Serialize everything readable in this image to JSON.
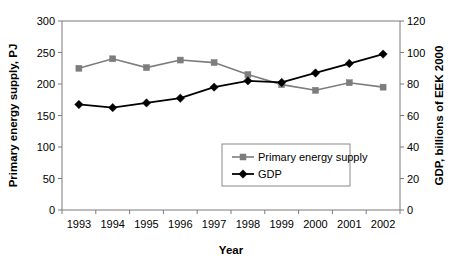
{
  "chart_data": {
    "type": "line",
    "title": "",
    "xlabel": "Year",
    "categories": [
      "1993",
      "1994",
      "1995",
      "1996",
      "1997",
      "1998",
      "1999",
      "2000",
      "2001",
      "2002"
    ],
    "grid": false,
    "legend_position": "inside-center-right",
    "axes": {
      "left": {
        "label": "Primary energy supply, PJ",
        "ticks": [
          "0",
          "50",
          "100",
          "150",
          "200",
          "250",
          "300"
        ],
        "tick_values": [
          0,
          50,
          100,
          150,
          200,
          250,
          300
        ],
        "ylim": [
          0,
          300
        ]
      },
      "right": {
        "label": "GDP, billions of EEK 2000",
        "ticks": [
          "0",
          "20",
          "40",
          "60",
          "80",
          "100",
          "120"
        ],
        "tick_values": [
          0,
          20,
          40,
          60,
          80,
          100,
          120
        ],
        "ylim": [
          0,
          120
        ]
      }
    },
    "series": [
      {
        "name": "Primary energy supply",
        "axis": "left",
        "color": "#7d7d7d",
        "marker": "square",
        "values": [
          225,
          240,
          226,
          238,
          234,
          215,
          199,
          190,
          202,
          195
        ]
      },
      {
        "name": "GDP",
        "axis": "right",
        "color": "#000000",
        "marker": "diamond",
        "values": [
          67,
          65,
          68,
          71,
          78,
          82,
          81,
          87,
          93,
          99
        ]
      }
    ]
  },
  "legend": {
    "entries": [
      {
        "label": "Primary energy supply"
      },
      {
        "label": "GDP"
      }
    ]
  }
}
